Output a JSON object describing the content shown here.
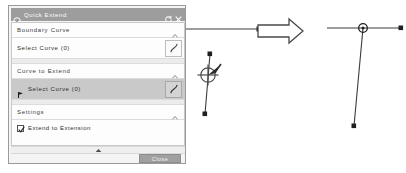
{
  "dialog": {
    "title": "Quick Extend",
    "title_icon": "gear-icon",
    "reset_icon": "reset-circular-arrow-icon",
    "close_icon": "close-x-icon",
    "sections": [
      {
        "header": "Boundary Curve",
        "collapse_icon": "chevron-up-icon",
        "row_label": "Select Curve (0)",
        "row_icon": "curve-select-icon",
        "selected": false
      },
      {
        "header": "Curve to Extend",
        "collapse_icon": "chevron-up-icon",
        "row_label": "Select Curve (0)",
        "row_icon": "curve-select-icon",
        "selected": true
      },
      {
        "header": "Settings",
        "collapse_icon": "chevron-up-icon"
      }
    ],
    "settings": {
      "checkbox_label": "Extend to Extension",
      "checked": true
    },
    "collapse_handle_icon": "triangle-up-icon",
    "close_button_label": "Close",
    "colors": {
      "titlebar": "#9d9d9d",
      "panel_bg": "#f4f4f4",
      "body_bg": "#fdfdfd",
      "selected_row": "#c9c9c9",
      "button": "#a0a0a0",
      "border": "#9a9a9a"
    }
  },
  "diagram": {
    "transition_arrow_icon": "right-arrow-icon",
    "before": {
      "caption": "",
      "horizontal_line": "boundary curve",
      "vertical_line": "curve to extend",
      "cursor_icon": "extend-cursor-crosshair-icon"
    },
    "after": {
      "caption": "",
      "horizontal_line": "boundary curve",
      "vertical_line": "extended curve",
      "intersection_marker_icon": "intersection-point-icon"
    },
    "colors": {
      "line": "#3c3c3c",
      "arrow_outline": "#4a4a4a"
    }
  }
}
